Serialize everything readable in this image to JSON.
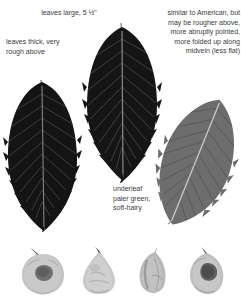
{
  "figure": {
    "background_color": "#ffffff",
    "text_color": "#3d3d3d"
  },
  "annotations": [
    {
      "id": "leaves-large",
      "text": "leaves large, 5 ½\""
    },
    {
      "id": "leaves-thick",
      "text": "leaves thick, very\nrough above"
    },
    {
      "id": "similar-to-american",
      "text": "similar to American, but\nmay be rougher above,\nmore abruptly pointed,\nmore folded up along\nmidvein (less flat)"
    },
    {
      "id": "underleaf",
      "text": "underleaf\npaler green,\nsoft-hairy"
    }
  ],
  "specimens": {
    "leaves": [
      {
        "id": "leaf-left",
        "label": "upper-surface leaf, dark, partially cropped at left",
        "fill_color": "#141414",
        "vein_color": "#4a4a4a",
        "midrib_color": "#8a8a8a"
      },
      {
        "id": "leaf-center",
        "label": "upper-surface leaf, dark, full specimen",
        "fill_color": "#161616",
        "vein_color": "#4d4d4d",
        "midrib_color": "#909090"
      },
      {
        "id": "leaf-right",
        "label": "underleaf surface, mid-gray, tilted",
        "fill_color": "#6e6e6e",
        "vein_color": "#565656",
        "midrib_color": "#c9c9c9"
      }
    ],
    "nuts": [
      {
        "id": "nut-1",
        "label": "round nut with dark flattened center scar",
        "fill_color": "#c2c2c2",
        "scar_color": "#6f6f6f"
      },
      {
        "id": "nut-2",
        "label": "teardrop nut, pale, pointed tip",
        "fill_color": "#c8c8c8",
        "scar_color": "#a8a8a8"
      },
      {
        "id": "nut-3",
        "label": "narrow pointed nut, shaded left side",
        "fill_color": "#b9b9b9",
        "scar_color": "#8c8c8c"
      },
      {
        "id": "nut-4",
        "label": "oval nut with dark central scar",
        "fill_color": "#c0c0c0",
        "scar_color": "#5f5f5f"
      }
    ]
  }
}
